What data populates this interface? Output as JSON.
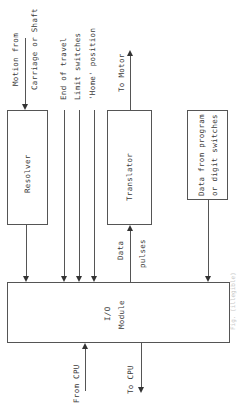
{
  "diagram": {
    "type": "block diagram",
    "orientation": "rotated 90 degrees counter-clockwise",
    "blocks": {
      "resolver": "Resolver",
      "translator": "Translator",
      "data_source": [
        "Data from program",
        "or digit switches"
      ],
      "io_module": [
        "I/O",
        "Module"
      ]
    },
    "signals": {
      "motion_from": [
        "Motion from",
        "Carriage or Shaft"
      ],
      "end_of_travel": [
        "End of travel",
        "Limit switches",
        "'Home' position"
      ],
      "to_motor": "To Motor",
      "data_pulses": [
        "Data",
        "pulses"
      ],
      "from_cpu": "From CPU",
      "to_cpu": "To CPU"
    },
    "caption": "Fig. (illegible)"
  }
}
